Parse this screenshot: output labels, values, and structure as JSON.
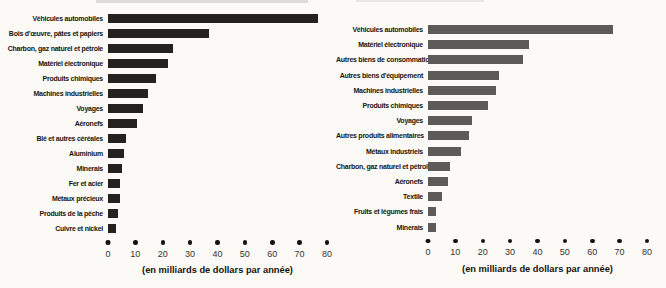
{
  "axis_note": "(en milliards de dollars par année)",
  "chart_data": [
    {
      "type": "bar",
      "orientation": "horizontal",
      "categories": [
        "Véhicules automobiles",
        "Bois d'œuvre, pâtes et papiers",
        "Charbon, gaz naturel et pétrole",
        "Matériel électronique",
        "Produits chimiques",
        "Machines industrielles",
        "Voyages",
        "Aéronefs",
        "Blé et autres céréales",
        "Aluminium",
        "Minerais",
        "Fer et acier",
        "Métaux précieux",
        "Produits de la pêche",
        "Cuivre et nickel"
      ],
      "values": [
        77,
        37,
        24,
        22,
        17.5,
        14.5,
        13,
        10.5,
        6.5,
        6,
        5,
        4.5,
        4.5,
        3.5,
        3
      ],
      "title": "",
      "xlabel": "(en milliards de dollars par année)",
      "ylabel": "",
      "xlim": [
        0,
        80
      ],
      "xticks": [
        0,
        10,
        20,
        30,
        40,
        50,
        60,
        70,
        80
      ],
      "grid": false,
      "legend": false,
      "bar_color": "#24211e",
      "tick_dot_color": "#15130f"
    },
    {
      "type": "bar",
      "orientation": "horizontal",
      "categories": [
        "Véhicules automobiles",
        "Matériel électronique",
        "Autres biens de consommation",
        "Autres biens d'équipement",
        "Machines industrielles",
        "Produits chimiques",
        "Voyages",
        "Autres produits alimentaires",
        "Métaux industriels",
        "Charbon, gaz naturel et pétrole",
        "Aéronefs",
        "Textile",
        "Fruits et légumes frais",
        "Minerais"
      ],
      "values": [
        68,
        37,
        35,
        26,
        25,
        22,
        16,
        15,
        12,
        8,
        7.5,
        5,
        3,
        3
      ],
      "title": "",
      "xlabel": "(en milliards de dollars par année)",
      "ylabel": "",
      "xlim": [
        0,
        80
      ],
      "xticks": [
        0,
        10,
        20,
        30,
        40,
        50,
        60,
        70,
        80
      ],
      "grid": false,
      "legend": false,
      "bar_color": "#5d5b58",
      "tick_dot_color": "#15130f"
    }
  ]
}
